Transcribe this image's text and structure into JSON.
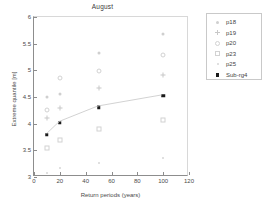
{
  "chart_data": {
    "type": "scatter",
    "title": "August",
    "xlabel": "Return periods (years)",
    "ylabel": "Extreme quantile [m]",
    "xlim": [
      0,
      120
    ],
    "ylim": [
      3,
      6
    ],
    "xticks": [
      "0",
      "20",
      "40",
      "60",
      "80",
      "100",
      "120"
    ],
    "yticks": [
      "3",
      "3.5",
      "4",
      "4.5",
      "5",
      "5.5",
      "6"
    ],
    "grid": false,
    "legend_position": "outside-right-top",
    "x": [
      10,
      20,
      50,
      100
    ],
    "series": [
      {
        "name": "p18",
        "marker": "dot",
        "values": [
          4.5,
          4.55,
          5.32,
          5.69
        ]
      },
      {
        "name": "p19",
        "marker": "plus",
        "values": [
          4.1,
          4.3,
          4.66,
          4.91
        ]
      },
      {
        "name": "p20",
        "marker": "circle",
        "values": [
          4.25,
          4.85,
          4.98,
          5.29
        ]
      },
      {
        "name": "p23",
        "marker": "square",
        "values": [
          3.55,
          3.7,
          3.9,
          4.07
        ]
      },
      {
        "name": "p25",
        "marker": "point",
        "values": [
          3.08,
          3.17,
          3.27,
          3.35
        ]
      },
      {
        "name": "Sub-rg4",
        "marker": "filled-square-line",
        "values": [
          3.79,
          4.02,
          4.31,
          4.52
        ]
      }
    ]
  },
  "legend": {
    "entries": [
      {
        "label": "p18"
      },
      {
        "label": "p19"
      },
      {
        "label": "p20"
      },
      {
        "label": "p23"
      },
      {
        "label": "p25"
      },
      {
        "label": "Sub-rg4"
      }
    ]
  },
  "colors": {
    "faint_marker": "#d0d0d0",
    "emphasis_marker": "#1a1a1a",
    "axis": "#8d8d8d",
    "text": "#3f3f3f",
    "trend_line": "#cccccc"
  }
}
